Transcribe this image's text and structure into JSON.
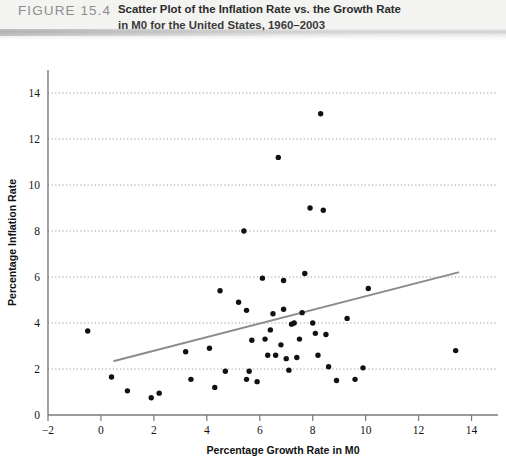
{
  "figure": {
    "number_label": "FIGURE 15.4",
    "caption_line_1": "Scatter Plot of the Inflation Rate vs. the Growth Rate",
    "caption_line_2": "in M0 for the United States, 1960–2003"
  },
  "colors": {
    "point": "#111111",
    "trendline": "#8c8c8c",
    "axis": "#7a7a7a",
    "gridline": "#9a9a9a",
    "header_band": "#f3f3f1",
    "figure_number": "#8d8d8d"
  },
  "chart_data": {
    "type": "scatter",
    "title": "Scatter Plot of the Inflation Rate vs. the Growth Rate in M0 for the United States, 1960–2003",
    "xlabel": "Percentage Growth Rate in M0",
    "ylabel": "Percentage Inflation Rate",
    "xlim": [
      -2,
      15
    ],
    "ylim": [
      0,
      15
    ],
    "xticks": [
      -2,
      0,
      2,
      4,
      6,
      8,
      10,
      12,
      14
    ],
    "yticks": [
      0,
      2,
      4,
      6,
      8,
      10,
      12,
      14
    ],
    "xtick_labels": [
      "−2",
      "0",
      "2",
      "4",
      "6",
      "8",
      "10",
      "12",
      "14"
    ],
    "ytick_labels": [
      "0",
      "2",
      "4",
      "6",
      "8",
      "10",
      "12",
      "14"
    ],
    "grid": "horizontal-dotted",
    "legend": "none",
    "x": [
      -0.5,
      0.4,
      1.0,
      1.9,
      2.2,
      3.2,
      3.4,
      4.1,
      4.3,
      4.5,
      4.7,
      5.2,
      5.4,
      5.5,
      5.5,
      5.6,
      5.7,
      5.9,
      6.1,
      6.2,
      6.3,
      6.4,
      6.5,
      6.6,
      6.7,
      6.8,
      6.9,
      6.9,
      7.0,
      7.1,
      7.2,
      7.3,
      7.4,
      7.5,
      7.6,
      7.7,
      7.9,
      8.0,
      8.1,
      8.2,
      8.3,
      8.4,
      8.5,
      8.6,
      8.9,
      9.3,
      9.6,
      9.9,
      10.1,
      13.4
    ],
    "y": [
      3.65,
      1.65,
      1.05,
      0.75,
      0.95,
      2.75,
      1.55,
      2.9,
      1.2,
      5.4,
      1.9,
      4.9,
      8.0,
      4.55,
      1.55,
      1.9,
      3.25,
      1.45,
      5.95,
      3.3,
      2.6,
      3.7,
      4.4,
      2.6,
      11.2,
      3.05,
      4.6,
      5.85,
      2.45,
      1.95,
      3.95,
      4.0,
      2.5,
      3.3,
      4.45,
      6.15,
      9.0,
      4.0,
      3.55,
      2.6,
      13.1,
      8.9,
      3.5,
      2.1,
      1.5,
      4.2,
      1.55,
      2.05,
      5.5,
      2.8
    ],
    "trendline": {
      "x_start": 0.5,
      "y_start": 2.35,
      "x_end": 13.5,
      "y_end": 6.2,
      "color": "#8c8c8c",
      "width": 2
    },
    "n_points": 50
  }
}
